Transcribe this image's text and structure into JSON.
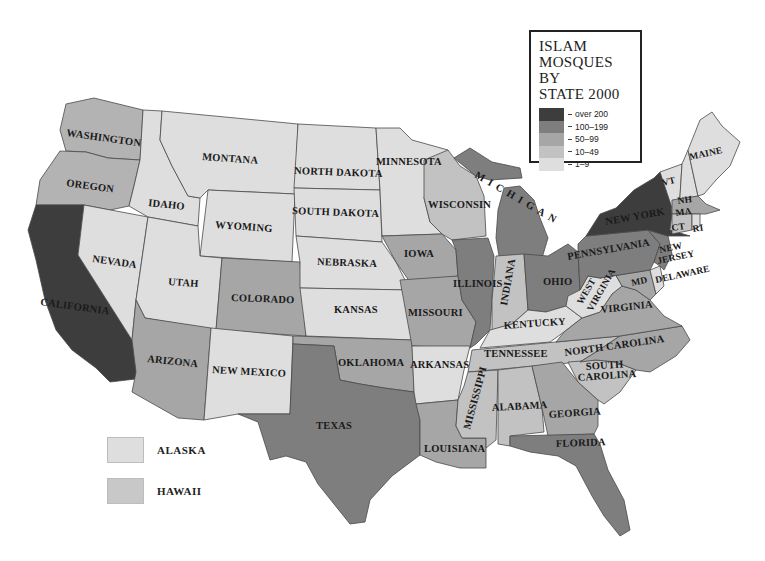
{
  "legend": {
    "title_lines": [
      "ISLAM",
      "MOSQUES BY",
      "STATE 2000"
    ],
    "classes": [
      {
        "label": "over 200",
        "color": "#3d3d3d"
      },
      {
        "label": "100–199",
        "color": "#7e7e7e"
      },
      {
        "label": "50–99",
        "color": "#a6a6a6"
      },
      {
        "label": "10–49",
        "color": "#c2c2c2"
      },
      {
        "label": "1–9",
        "color": "#dedede"
      }
    ]
  },
  "insets": [
    {
      "label": "ALASKA",
      "color": "#dedede"
    },
    {
      "label": "HAWAII",
      "color": "#c2c2c2"
    }
  ],
  "states": {
    "washington": "WASHINGTON",
    "oregon": "OREGON",
    "california": "CALIFORNIA",
    "nevada": "NEVADA",
    "idaho": "IDAHO",
    "montana": "MONTANA",
    "wyoming": "WYOMING",
    "utah": "UTAH",
    "colorado": "COLORADO",
    "arizona": "ARIZONA",
    "new_mexico": "NEW MEXICO",
    "north_dakota": "NORTH DAKOTA",
    "south_dakota": "SOUTH DAKOTA",
    "nebraska": "NEBRASKA",
    "kansas": "KANSAS",
    "oklahoma": "OKLAHOMA",
    "texas": "TEXAS",
    "minnesota": "MINNESOTA",
    "iowa": "IOWA",
    "missouri": "MISSOURI",
    "arkansas": "ARKANSAS",
    "louisiana": "LOUISIANA",
    "wisconsin": "WISCONSIN",
    "illinois": "ILLINOIS",
    "michigan": "MICHIGAN",
    "indiana": "INDIANA",
    "ohio": "OHIO",
    "kentucky": "KENTUCKY",
    "tennessee": "TENNESSEE",
    "mississippi": "MISSISSIPPI",
    "alabama": "ALABAMA",
    "georgia": "GEORGIA",
    "florida": "FLORIDA",
    "south_carolina_1": "SOUTH",
    "south_carolina_2": "CAROLINA",
    "north_carolina": "NORTH CAROLINA",
    "virginia": "VIRGINIA",
    "west_virginia_1": "WEST",
    "west_virginia_2": "VIRGINIA",
    "pennsylvania": "PENNSYLVANIA",
    "new_york": "NEW YORK",
    "new_jersey_1": "NEW",
    "new_jersey_2": "JERSEY",
    "delaware": "DELAWARE",
    "maryland": "MD",
    "vermont": "VT",
    "new_hampshire": "NH",
    "massachusetts": "MA",
    "connecticut": "CT",
    "rhode_island": "RI",
    "maine": "MAINE"
  },
  "state_classes": {
    "california": "over 200",
    "new_york": "over 200",
    "texas": "100–199",
    "illinois": "100–199",
    "michigan": "100–199",
    "new_jersey": "100–199",
    "pennsylvania": "100–199",
    "florida": "100–199",
    "ohio": "100–199",
    "maryland": "50–99",
    "virginia": "50–99",
    "georgia": "50–99",
    "massachusetts": "50–99",
    "north_carolina": "50–99",
    "washington": "10–49",
    "oregon": "10–49",
    "colorado": "10–49",
    "arizona": "10–49",
    "oklahoma": "10–49",
    "iowa": "10–49",
    "missouri": "10–49",
    "louisiana": "10–49",
    "wisconsin": "10–49",
    "indiana": "10–49",
    "tennessee": "10–49",
    "mississippi": "10–49",
    "alabama": "10–49",
    "south_carolina": "10–49",
    "connecticut": "10–49",
    "minnesota": "1–9",
    "kentucky": "1–9",
    "arkansas": "1–9",
    "nevada": "1–9",
    "idaho": "1–9",
    "montana": "1–9",
    "wyoming": "1–9",
    "utah": "1–9",
    "new_mexico": "1–9",
    "north_dakota": "1–9",
    "south_dakota": "1–9",
    "nebraska": "1–9",
    "kansas": "1–9",
    "west_virginia": "1–9",
    "delaware": "1–9",
    "vermont": "1–9",
    "new_hampshire": "1–9",
    "maine": "1–9",
    "rhode_island": "1–9",
    "alaska": "1–9",
    "hawaii": "10–49"
  }
}
